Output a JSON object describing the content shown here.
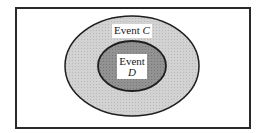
{
  "diagram": {
    "type": "venn-subset",
    "outer_set": {
      "label_word": "Event",
      "label_var": "C",
      "fill": "#cfcfcf",
      "stroke": "#1e1e1e"
    },
    "inner_set": {
      "label_word": "Event",
      "label_var": "D",
      "fill": "#8f8f8f",
      "stroke": "#1e1e1e"
    },
    "relationship": "Event D is a subset of Event C"
  }
}
